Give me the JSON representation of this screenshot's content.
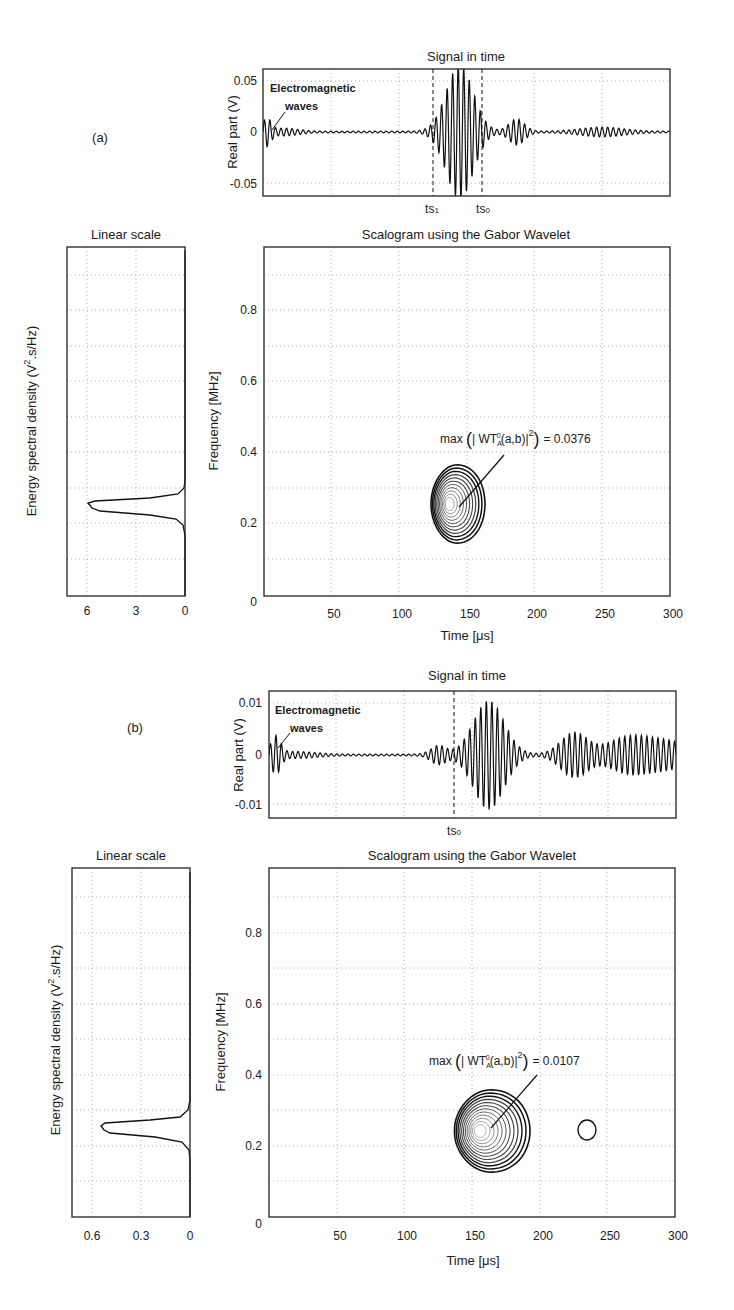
{
  "panels": [
    {
      "label": "(a)",
      "signal": {
        "title": "Signal in time",
        "ylabel": "Real part (V)",
        "yticks": [
          "0.05",
          "0",
          "-0.05"
        ],
        "annotation": [
          "Electromagnetic",
          "waves"
        ],
        "markers": [
          "ts1",
          "ts0"
        ],
        "marker_display": [
          {
            "main": "ts",
            "sub": "1"
          },
          {
            "main": "ts",
            "sub": "0"
          }
        ]
      },
      "esd": {
        "title": "Linear scale",
        "ylabel": "Energy spectral density (V",
        "ylabel_sup": "2",
        "ylabel_tail": ".s/Hz)",
        "xticks": [
          "6",
          "3",
          "0"
        ]
      },
      "scalogram": {
        "title": "Scalogram using the Gabor Wavelet",
        "ylabel": "Frequency [MHz]",
        "xlabel": "Time [μs]",
        "yticks": [
          "0.8",
          "0.6",
          "0.4",
          "0.2",
          "0"
        ],
        "xticks": [
          "50",
          "100",
          "150",
          "200",
          "250",
          "300"
        ],
        "annotation": "max ( | WT_A^0(a,b) |^2 ) = 0.0376",
        "ann_value": "= 0.0376"
      }
    },
    {
      "label": "(b)",
      "signal": {
        "title": "Signal in time",
        "ylabel": "Real part (V)",
        "yticks": [
          "0.01",
          "0",
          "-0.01"
        ],
        "annotation": [
          "Electromagnetic",
          "waves"
        ],
        "markers": [
          "ts0"
        ],
        "marker_display": [
          {
            "main": "ts",
            "sub": "0"
          }
        ]
      },
      "esd": {
        "title": "Linear scale",
        "ylabel": "Energy spectral density (V",
        "ylabel_sup": "2",
        "ylabel_tail": ".s/Hz)",
        "xticks": [
          "0.6",
          "0.3",
          "0"
        ]
      },
      "scalogram": {
        "title": "Scalogram using the Gabor Wavelet",
        "ylabel": "Frequency [MHz]",
        "xlabel": "Time [μs]",
        "yticks": [
          "0.8",
          "0.6",
          "0.4",
          "0.2",
          "0"
        ],
        "xticks": [
          "50",
          "100",
          "150",
          "200",
          "250",
          "300"
        ],
        "annotation": "max ( | WT_A^0(a,b) |^2 ) = 0.0107",
        "ann_value": "= 0.0107"
      }
    }
  ],
  "chart_data": [
    {
      "type": "line",
      "title": "Signal in time",
      "panel": "(a)",
      "xlabel": "",
      "ylabel": "Real part (V)",
      "ylim": [
        -0.06,
        0.06
      ],
      "xlim": [
        0,
        300
      ],
      "yticks": [
        -0.05,
        0,
        0.05
      ],
      "grid": true,
      "annotations": [
        "Electromagnetic waves",
        "ts1",
        "ts0"
      ],
      "marker_times_us": {
        "ts1": 127,
        "ts0": 163
      },
      "series": [
        {
          "name": "signal",
          "description": "EM wave burst near t=0 (~0.01 V), main burst 120-175 μs peaking ~0.06 V around 145 μs, small echo ~180-200 μs (~0.01 V), weak trailing oscillation 220-280 μs"
        }
      ]
    },
    {
      "type": "line",
      "title": "Linear scale",
      "panel": "(a)",
      "xlabel": "",
      "ylabel": "Energy spectral density (V^2.s/Hz)",
      "xlim": [
        7.2,
        0
      ],
      "ylim": [
        0,
        1
      ],
      "xticks": [
        6,
        3,
        0
      ],
      "grid": true,
      "series": [
        {
          "name": "ESD",
          "freq_MHz": [
            0.15,
            0.2,
            0.22,
            0.24,
            0.25,
            0.26,
            0.28,
            0.3,
            0.35
          ],
          "values": [
            0,
            0.05,
            1.0,
            5.5,
            6.0,
            4.0,
            0.7,
            0.1,
            0
          ]
        }
      ]
    },
    {
      "type": "heatmap",
      "title": "Scalogram using the Gabor Wavelet",
      "panel": "(a)",
      "xlabel": "Time [μs]",
      "ylabel": "Frequency [MHz]",
      "xlim": [
        0,
        300
      ],
      "ylim": [
        0,
        1
      ],
      "xticks": [
        50,
        100,
        150,
        200,
        250,
        300
      ],
      "yticks": [
        0,
        0.2,
        0.4,
        0.6,
        0.8
      ],
      "grid": true,
      "contour_center": {
        "time_us": 142,
        "freq_MHz": 0.25
      },
      "contour_extent": {
        "time_us": [
          128,
          168
        ],
        "freq_MHz": [
          0.14,
          0.36
        ]
      },
      "annotation": "max(|WT_A^0(a,b)|^2) = 0.0376",
      "max_value": 0.0376
    },
    {
      "type": "line",
      "title": "Signal in time",
      "panel": "(b)",
      "xlabel": "",
      "ylabel": "Real part (V)",
      "ylim": [
        -0.012,
        0.012
      ],
      "xlim": [
        0,
        300
      ],
      "yticks": [
        -0.01,
        0,
        0.01
      ],
      "grid": true,
      "annotations": [
        "Electromagnetic waves",
        "ts0"
      ],
      "marker_times_us": {
        "ts0": 137
      },
      "series": [
        {
          "name": "signal",
          "description": "EM wave burst near t=0 (~0.003 V), small precursor 115-135 μs, main burst 140-200 μs peaking ~0.012 V around 160 μs, secondary packet 210-250 μs (~0.005 V), continuing oscillation to 300 μs (~0.003 V)"
        }
      ]
    },
    {
      "type": "line",
      "title": "Linear scale",
      "panel": "(b)",
      "xlabel": "",
      "ylabel": "Energy spectral density (V^2.s/Hz)",
      "xlim": [
        0.72,
        0
      ],
      "ylim": [
        0,
        1
      ],
      "xticks": [
        0.6,
        0.3,
        0
      ],
      "grid": true,
      "series": [
        {
          "name": "ESD",
          "freq_MHz": [
            0.15,
            0.2,
            0.22,
            0.24,
            0.25,
            0.26,
            0.28,
            0.3,
            0.35
          ],
          "values": [
            0,
            0.01,
            0.05,
            0.5,
            0.55,
            0.4,
            0.06,
            0.01,
            0
          ]
        }
      ]
    },
    {
      "type": "heatmap",
      "title": "Scalogram using the Gabor Wavelet",
      "panel": "(b)",
      "xlabel": "Time [μs]",
      "ylabel": "Frequency [MHz]",
      "xlim": [
        0,
        300
      ],
      "ylim": [
        0,
        1
      ],
      "xticks": [
        50,
        100,
        150,
        200,
        250,
        300
      ],
      "yticks": [
        0,
        0.2,
        0.4,
        0.6,
        0.8
      ],
      "grid": true,
      "contour_center": {
        "time_us": 163,
        "freq_MHz": 0.25
      },
      "contour_extent": {
        "time_us": [
          140,
          200
        ],
        "freq_MHz": [
          0.13,
          0.36
        ]
      },
      "secondary_contour": {
        "time_us": 232,
        "freq_MHz": 0.24
      },
      "annotation": "max(|WT_A^0(a,b)|^2) = 0.0107",
      "max_value": 0.0107
    }
  ]
}
